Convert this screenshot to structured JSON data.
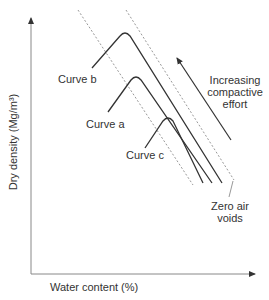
{
  "diagram": {
    "title": "",
    "axes": {
      "x_label": "Water content (%)",
      "y_label": "Dry density (Mg/m³)"
    },
    "curves": [
      {
        "name": "Curve b",
        "label": "Curve b"
      },
      {
        "name": "Curve a",
        "label": "Curve a"
      },
      {
        "name": "Curve c",
        "label": "Curve c"
      }
    ],
    "annotations": {
      "arrow_label_line1": "Increasing",
      "arrow_label_line2": "compactive",
      "arrow_label_line3": "effort",
      "zav_line1": "Zero air",
      "zav_line2": "voids"
    },
    "colors": {
      "line": "#333333",
      "dashed": "#999999",
      "axis": "#888888"
    }
  }
}
